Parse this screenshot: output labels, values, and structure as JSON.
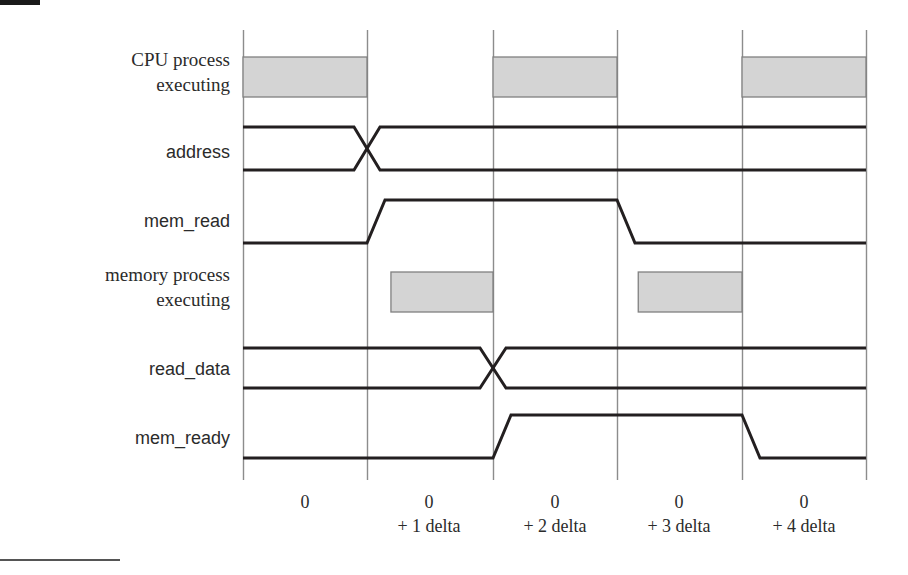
{
  "figure": {
    "type": "timing-diagram",
    "width": 908,
    "height": 575,
    "colors": {
      "waveform": "#231f20",
      "gridline": "#8c8c8c",
      "box_fill": "#d4d4d4",
      "box_stroke": "#808080",
      "text": "#2b2b2b",
      "background": "#ffffff"
    }
  },
  "rows": [
    {
      "id": "cpu-process-executing",
      "label": "CPU process\nexecuting",
      "label_font": "serif",
      "kind": "activity-bar",
      "label_y": 48,
      "box_top": 57,
      "box_bottom": 97,
      "segments": [
        {
          "start_grid": 0,
          "end_grid": 1
        },
        {
          "start_grid": 2,
          "end_grid": 3
        },
        {
          "start_grid": 4,
          "end_grid": 5
        }
      ]
    },
    {
      "id": "address",
      "label": "address",
      "label_font": "sans",
      "kind": "bus",
      "label_y": 141,
      "top_rail": 127,
      "bottom_rail": 170,
      "transitions": [
        {
          "grid": 1
        }
      ]
    },
    {
      "id": "mem-read",
      "label": "mem_read",
      "label_font": "sans",
      "kind": "signal",
      "label_y": 210,
      "high_level": 200,
      "low_level": 243,
      "initial": "low",
      "edges": [
        {
          "grid": 1,
          "to": "high"
        },
        {
          "grid": 3,
          "to": "low"
        }
      ]
    },
    {
      "id": "memory-process-executing",
      "label": "memory process\nexecuting",
      "label_font": "serif",
      "kind": "activity-bar",
      "label_y": 263,
      "box_top": 272,
      "box_bottom": 312,
      "segments": [
        {
          "start_grid": 1.19,
          "end_grid": 2
        },
        {
          "start_grid": 3.17,
          "end_grid": 4
        }
      ]
    },
    {
      "id": "read-data",
      "label": "read_data",
      "label_font": "sans",
      "kind": "bus",
      "label_y": 358,
      "top_rail": 348,
      "bottom_rail": 388,
      "transitions": [
        {
          "grid": 2
        }
      ]
    },
    {
      "id": "mem-ready",
      "label": "mem_ready",
      "label_font": "sans",
      "kind": "signal",
      "label_y": 427,
      "high_level": 415,
      "low_level": 458,
      "initial": "low",
      "edges": [
        {
          "grid": 2,
          "to": "high"
        },
        {
          "grid": 4,
          "to": "low"
        }
      ]
    }
  ],
  "time_axis": {
    "grid_x": [
      243,
      367,
      493,
      617,
      742,
      866
    ],
    "grid_top": 30,
    "grid_bottom": 480,
    "ticks": [
      {
        "grid": 0,
        "line1": "0",
        "line2": ""
      },
      {
        "grid": 1,
        "line1": "0",
        "line2": "+ 1 delta"
      },
      {
        "grid": 2,
        "line1": "0",
        "line2": "+ 2 delta"
      },
      {
        "grid": 3,
        "line1": "0",
        "line2": "+ 3 delta"
      },
      {
        "grid": 4,
        "line1": "0",
        "line2": "+ 4 delta"
      }
    ],
    "label_y_line1": 490,
    "label_y_line2": 516
  },
  "chart_data": {
    "type": "timing-diagram",
    "title": "",
    "xlabel": "",
    "ylabel": "",
    "time_points": [
      "0",
      "0 + 1 delta",
      "0 + 2 delta",
      "0 + 3 delta",
      "0 + 4 delta"
    ],
    "signals": [
      {
        "name": "CPU process executing",
        "type": "activity",
        "active_intervals": [
          [
            0,
            1
          ],
          [
            2,
            3
          ],
          [
            4,
            5
          ]
        ]
      },
      {
        "name": "address",
        "type": "bus",
        "change_times": [
          1
        ]
      },
      {
        "name": "mem_read",
        "type": "binary",
        "values": [
          0,
          1,
          1,
          0,
          0
        ],
        "rising_edges": [
          1
        ],
        "falling_edges": [
          3
        ]
      },
      {
        "name": "memory process executing",
        "type": "activity",
        "active_intervals": [
          [
            1.19,
            2
          ],
          [
            3.17,
            4
          ]
        ]
      },
      {
        "name": "read_data",
        "type": "bus",
        "change_times": [
          2
        ]
      },
      {
        "name": "mem_ready",
        "type": "binary",
        "values": [
          0,
          0,
          1,
          1,
          0
        ],
        "rising_edges": [
          2
        ],
        "falling_edges": [
          4
        ]
      }
    ]
  }
}
